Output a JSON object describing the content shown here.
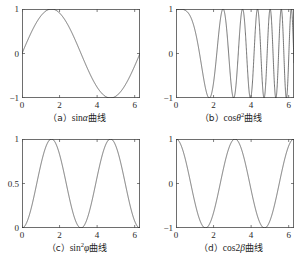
{
  "figure": {
    "background": "#ffffff",
    "line_color": "#3a3a3a",
    "axis_color": "#4a4a4a"
  },
  "panels": [
    {
      "id": "panel-a",
      "caption_prefix": "（a）",
      "caption_func": "sin",
      "caption_var": "α",
      "caption_sup": "",
      "caption_suffix": "曲线",
      "caption_full": "（a）sinα曲线"
    },
    {
      "id": "panel-b",
      "caption_prefix": "（b）",
      "caption_func": "cos",
      "caption_var": "θ",
      "caption_sup": "2",
      "caption_suffix": "曲线",
      "caption_full": "（b）cosθ2曲线"
    },
    {
      "id": "panel-c",
      "caption_prefix": "（c）",
      "caption_func": "sin",
      "caption_var": "φ",
      "caption_sup": "2",
      "caption_suffix": "曲线",
      "caption_full": "（c）sin2φ曲线"
    },
    {
      "id": "panel-d",
      "caption_prefix": "（d）",
      "caption_func": "cos2",
      "caption_var": "β",
      "caption_sup": "",
      "caption_suffix": "曲线",
      "caption_full": "（d）cos2β曲线"
    }
  ],
  "chart_data": [
    {
      "type": "line",
      "title": "（a）sinα曲线",
      "expression": "sin(alpha)",
      "xlabel": "",
      "ylabel": "",
      "xlim": [
        0,
        6.2832
      ],
      "ylim": [
        -1,
        1
      ],
      "xticks": [
        "0",
        "2",
        "4",
        "6"
      ],
      "xtick_values": [
        0,
        2,
        4,
        6
      ],
      "yticks": [
        "1",
        "0",
        "-1"
      ],
      "ytick_values": [
        1,
        0,
        -1
      ],
      "grid": false,
      "legend": "none"
    },
    {
      "type": "line",
      "title": "（b）cosθ2曲线",
      "expression": "cos(theta^2)",
      "xlabel": "",
      "ylabel": "",
      "xlim": [
        0,
        6.2832
      ],
      "ylim": [
        -1,
        1
      ],
      "xticks": [
        "0",
        "2",
        "4",
        "6"
      ],
      "xtick_values": [
        0,
        2,
        4,
        6
      ],
      "yticks": [
        "1",
        "0",
        "-1"
      ],
      "ytick_values": [
        1,
        0,
        -1
      ],
      "grid": false,
      "legend": "none"
    },
    {
      "type": "line",
      "title": "（c）sin2φ曲线",
      "expression": "sin(phi)^2",
      "xlabel": "",
      "ylabel": "",
      "xlim": [
        0,
        6.2832
      ],
      "ylim": [
        0,
        1
      ],
      "xticks": [
        "0",
        "2",
        "4",
        "6"
      ],
      "xtick_values": [
        0,
        2,
        4,
        6
      ],
      "yticks": [
        "1",
        "0.5",
        "0"
      ],
      "ytick_values": [
        1,
        0.5,
        0
      ],
      "grid": false,
      "legend": "none"
    },
    {
      "type": "line",
      "title": "（d）cos2β曲线",
      "expression": "cos(2*beta)",
      "xlabel": "",
      "ylabel": "",
      "xlim": [
        0,
        6.2832
      ],
      "ylim": [
        -1,
        1
      ],
      "xticks": [
        "0",
        "2",
        "4",
        "6"
      ],
      "xtick_values": [
        0,
        2,
        4,
        6
      ],
      "yticks": [
        "1",
        "0",
        "-1"
      ],
      "ytick_values": [
        1,
        0,
        -1
      ],
      "grid": false,
      "legend": "none"
    }
  ]
}
